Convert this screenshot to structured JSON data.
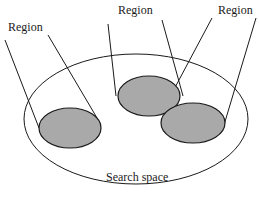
{
  "diagram": {
    "labels": {
      "region_left": "Region",
      "region_middle": "Region",
      "region_right": "Region",
      "search_space": "Search space"
    },
    "colors": {
      "stroke": "#1a1a1a",
      "region_fill": "#a9a9a9",
      "background": "#ffffff"
    },
    "regions_count": 3
  }
}
